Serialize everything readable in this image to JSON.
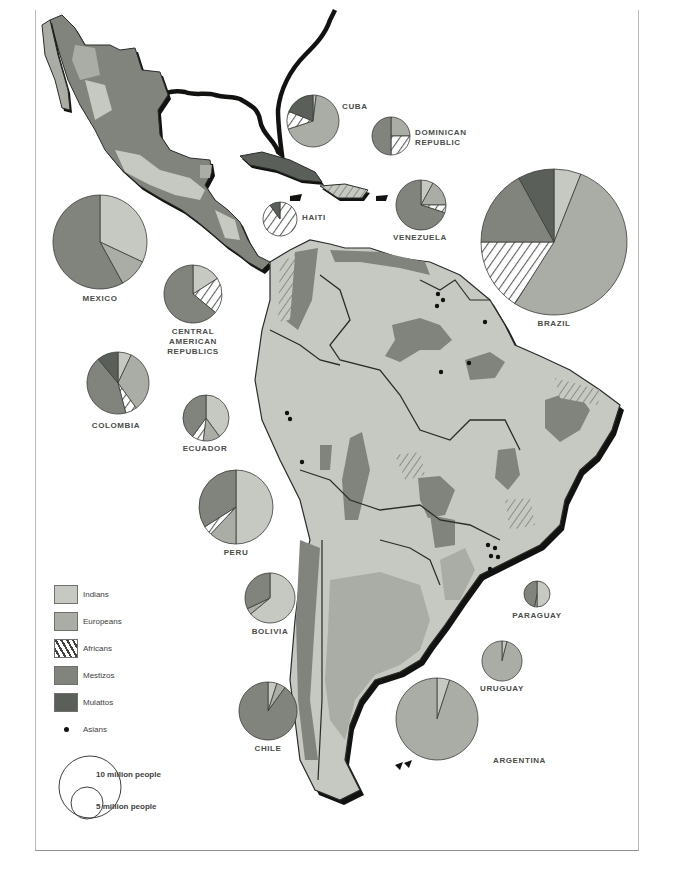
{
  "colors": {
    "Indians": "#c5c9c1",
    "Europeans": "#a9ada5",
    "Africans": "hatch",
    "Mestizos": "#80847d",
    "Mulattos": "#5b5f59",
    "Asians": "#111111",
    "outline": "#2a2c29",
    "shadow": "#121311"
  },
  "legend": {
    "items": [
      {
        "key": "Indians",
        "label": "Indians"
      },
      {
        "key": "Europeans",
        "label": "Europeans"
      },
      {
        "key": "Africans",
        "label": "Africans"
      },
      {
        "key": "Mestizos",
        "label": "Mestizos"
      },
      {
        "key": "Mulattos",
        "label": "Mulattos"
      },
      {
        "key": "Asians",
        "label": "Asians"
      }
    ],
    "scale": {
      "large_label": "10 million people",
      "small_label": "5 million people"
    }
  },
  "chart_data": {
    "type": "pie",
    "legend": [
      "Indians",
      "Europeans",
      "Africans",
      "Mestizos",
      "Mulattos",
      "Asians"
    ],
    "legend_position": "bottom-left",
    "size_scale": {
      "10 million people": 10,
      "5 million people": 5
    },
    "pies": [
      {
        "name": "MEXICO",
        "cx": 100,
        "cy": 242,
        "r": 47,
        "label_x": 100,
        "label_y": 294,
        "slices": [
          {
            "group": "Indians",
            "value": 32
          },
          {
            "group": "Europeans",
            "value": 10
          },
          {
            "group": "Mestizos",
            "value": 58
          }
        ]
      },
      {
        "name": "CUBA",
        "cx": 313,
        "cy": 121,
        "r": 26,
        "label_x": 342,
        "label_y": 102,
        "label_align": "left",
        "slices": [
          {
            "group": "Indians",
            "value": 2
          },
          {
            "group": "Europeans",
            "value": 68
          },
          {
            "group": "Africans",
            "value": 11
          },
          {
            "group": "Mulattos",
            "value": 19
          }
        ]
      },
      {
        "name": "DOMINICAN REPUBLIC",
        "lines": [
          "DOMINICAN",
          "REPUBLIC"
        ],
        "cx": 391,
        "cy": 136,
        "r": 19,
        "label_x": 415,
        "label_y": 128,
        "label_align": "left",
        "slices": [
          {
            "group": "Europeans",
            "value": 25
          },
          {
            "group": "Africans",
            "value": 25
          },
          {
            "group": "Mestizos",
            "value": 50
          }
        ]
      },
      {
        "name": "HAITI",
        "cx": 280,
        "cy": 219,
        "r": 17,
        "label_x": 302,
        "label_y": 213,
        "label_align": "left",
        "slices": [
          {
            "group": "Africans",
            "value": 90
          },
          {
            "group": "Mulattos",
            "value": 10
          }
        ]
      },
      {
        "name": "VENEZUELA",
        "cx": 421,
        "cy": 205,
        "r": 25,
        "label_x": 420,
        "label_y": 233,
        "slices": [
          {
            "group": "Indians",
            "value": 8
          },
          {
            "group": "Europeans",
            "value": 17
          },
          {
            "group": "Africans",
            "value": 5
          },
          {
            "group": "Mestizos",
            "value": 70
          }
        ]
      },
      {
        "name": "CENTRAL AMERICAN REPUBLICS",
        "lines": [
          "CENTRAL",
          "AMERICAN",
          "REPUBLICS"
        ],
        "cx": 193,
        "cy": 294,
        "r": 29,
        "label_x": 193,
        "label_y": 327,
        "slices": [
          {
            "group": "Indians",
            "value": 16
          },
          {
            "group": "Africans",
            "value": 20
          },
          {
            "group": "Mestizos",
            "value": 64
          }
        ]
      },
      {
        "name": "BRAZIL",
        "cx": 554,
        "cy": 242,
        "r": 73,
        "label_x": 554,
        "label_y": 319,
        "slices": [
          {
            "group": "Indians",
            "value": 6
          },
          {
            "group": "Europeans",
            "value": 53
          },
          {
            "group": "Africans",
            "value": 16
          },
          {
            "group": "Mestizos",
            "value": 17
          },
          {
            "group": "Mulattos",
            "value": 8
          }
        ]
      },
      {
        "name": "COLOMBIA",
        "cx": 118,
        "cy": 383,
        "r": 31,
        "label_x": 116,
        "label_y": 421,
        "slices": [
          {
            "group": "Indians",
            "value": 7
          },
          {
            "group": "Europeans",
            "value": 33
          },
          {
            "group": "Africans",
            "value": 6
          },
          {
            "group": "Mestizos",
            "value": 43
          },
          {
            "group": "Mulattos",
            "value": 11
          }
        ]
      },
      {
        "name": "ECUADOR",
        "cx": 206,
        "cy": 418,
        "r": 23,
        "label_x": 205,
        "label_y": 444,
        "slices": [
          {
            "group": "Indians",
            "value": 40
          },
          {
            "group": "Europeans",
            "value": 12
          },
          {
            "group": "Africans",
            "value": 8
          },
          {
            "group": "Mestizos",
            "value": 40
          }
        ]
      },
      {
        "name": "PERU",
        "cx": 236,
        "cy": 507,
        "r": 37,
        "label_x": 236,
        "label_y": 548,
        "slices": [
          {
            "group": "Indians",
            "value": 50
          },
          {
            "group": "Europeans",
            "value": 12
          },
          {
            "group": "Africans",
            "value": 4
          },
          {
            "group": "Mestizos",
            "value": 34
          }
        ]
      },
      {
        "name": "BOLIVIA",
        "cx": 270,
        "cy": 598,
        "r": 25,
        "label_x": 270,
        "label_y": 627,
        "slices": [
          {
            "group": "Indians",
            "value": 64
          },
          {
            "group": "Europeans",
            "value": 4
          },
          {
            "group": "Mestizos",
            "value": 32
          }
        ]
      },
      {
        "name": "CHILE",
        "cx": 268,
        "cy": 711,
        "r": 29,
        "label_x": 268,
        "label_y": 744,
        "slices": [
          {
            "group": "Indians",
            "value": 5
          },
          {
            "group": "Europeans",
            "value": 5
          },
          {
            "group": "Mestizos",
            "value": 90
          }
        ]
      },
      {
        "name": "PARAGUAY",
        "cx": 537,
        "cy": 594,
        "r": 13,
        "label_x": 537,
        "label_y": 611,
        "slices": [
          {
            "group": "Indians",
            "value": 50
          },
          {
            "group": "Europeans",
            "value": 3
          },
          {
            "group": "Mestizos",
            "value": 47
          }
        ]
      },
      {
        "name": "URUGUAY",
        "cx": 502,
        "cy": 661,
        "r": 20,
        "label_x": 502,
        "label_y": 684,
        "slices": [
          {
            "group": "Indians",
            "value": 4
          },
          {
            "group": "Europeans",
            "value": 96
          }
        ]
      },
      {
        "name": "ARGENTINA",
        "cx": 437,
        "cy": 719,
        "r": 41,
        "label_x": 493,
        "label_y": 756,
        "label_align": "left",
        "slices": [
          {
            "group": "Indians",
            "value": 5
          },
          {
            "group": "Europeans",
            "value": 95
          }
        ]
      }
    ]
  }
}
